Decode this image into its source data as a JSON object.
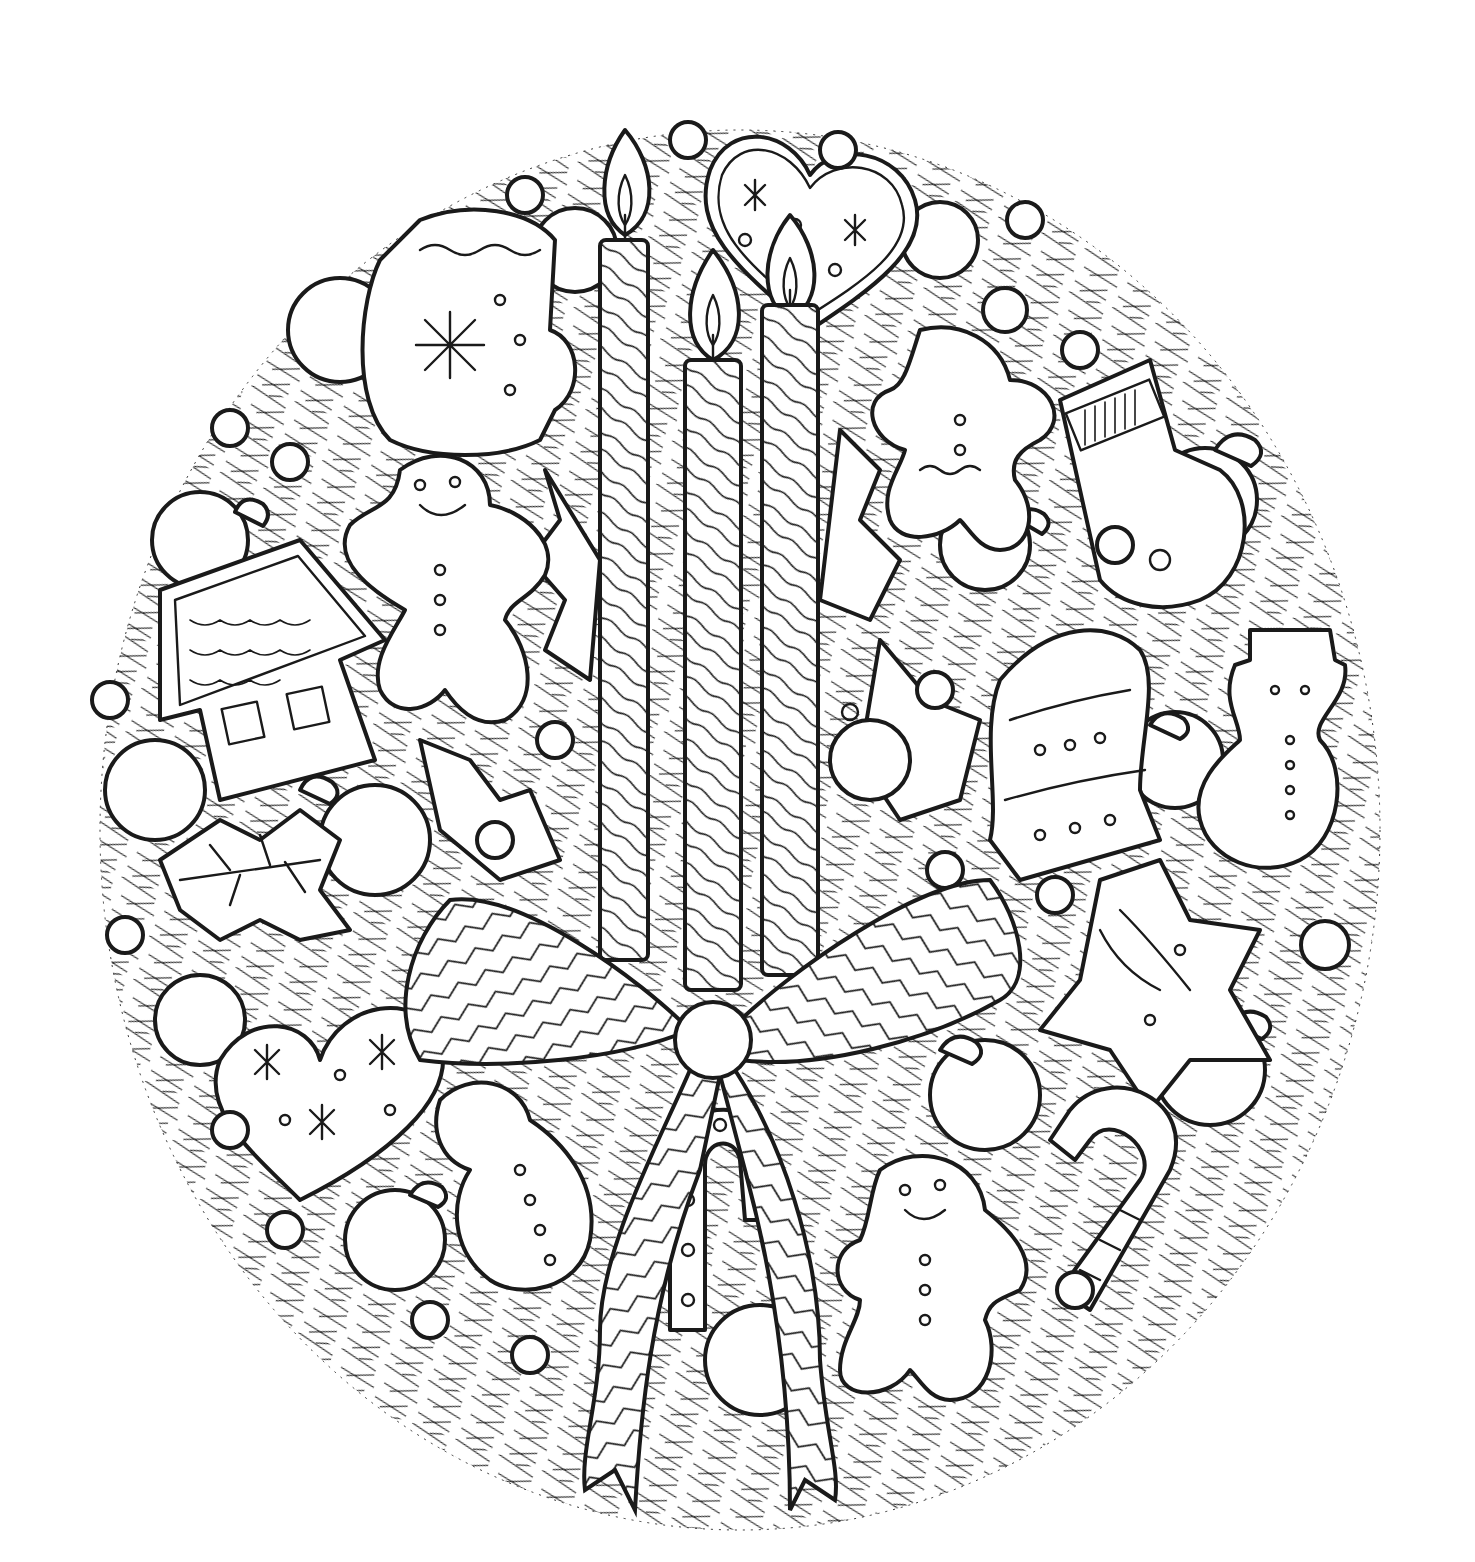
{
  "page": {
    "title": "",
    "background": "#ffffff",
    "ink_color": "#1a1a1a",
    "style": "black-and-white line-art coloring page"
  },
  "artwork": {
    "subject": "Christmas wreath with candles, bow and gingerbread cookies",
    "wreath": {
      "cx": 740,
      "cy": 830,
      "rx": 640,
      "ry": 700,
      "texture": "pine-needles"
    },
    "candles": [
      {
        "name": "left-candle",
        "x": 600,
        "top": 240,
        "bottom": 960,
        "width": 48,
        "flame_cy": 190
      },
      {
        "name": "middle-candle",
        "x": 685,
        "top": 360,
        "bottom": 990,
        "width": 56,
        "flame_cy": 300
      },
      {
        "name": "right-candle",
        "x": 762,
        "top": 305,
        "bottom": 975,
        "width": 56,
        "flame_cy": 250
      }
    ],
    "bow": {
      "knot_cx": 713,
      "knot_cy": 1040,
      "knot_r": 38,
      "pattern": "chevron-stripes"
    },
    "cookies": [
      {
        "name": "heart-cookie-top",
        "cx": 810,
        "cy": 240,
        "decor": [
          "snowflake",
          "snowflake",
          "dot",
          "dot",
          "dot"
        ]
      },
      {
        "name": "mitten-cookie",
        "cx": 470,
        "cy": 340,
        "decor": [
          "snowflake",
          "wavy-icing",
          "dots"
        ]
      },
      {
        "name": "gingerbread-man-left",
        "cx": 450,
        "cy": 580,
        "decor": [
          "smile",
          "buttons"
        ]
      },
      {
        "name": "gingerbread-house",
        "cx": 265,
        "cy": 660,
        "decor": [
          "scalloped-roof",
          "windows"
        ]
      },
      {
        "name": "gingerbread-man-top-right",
        "cx": 970,
        "cy": 450,
        "decor": [
          "buttons",
          "wavy-icing"
        ]
      },
      {
        "name": "stocking-cookie",
        "cx": 1160,
        "cy": 480,
        "decor": [
          "striped-cuff",
          "dots"
        ]
      },
      {
        "name": "bell-cookie",
        "cx": 1060,
        "cy": 760,
        "decor": [
          "dots",
          "bands"
        ]
      },
      {
        "name": "snowman-cookie-right",
        "cx": 1280,
        "cy": 740,
        "decor": [
          "hat",
          "buttons"
        ]
      },
      {
        "name": "star-cookie",
        "cx": 1140,
        "cy": 990,
        "decor": [
          "wavy-icing",
          "dots"
        ]
      },
      {
        "name": "holly-leaf-cookie",
        "cx": 250,
        "cy": 870,
        "decor": [
          "veins"
        ]
      },
      {
        "name": "heart-cookie-bottom",
        "cx": 330,
        "cy": 1090,
        "decor": [
          "snowflake",
          "snowflake",
          "dots"
        ]
      },
      {
        "name": "snowman-cookie-bottom",
        "cx": 520,
        "cy": 1180,
        "decor": [
          "buttons",
          "scarf"
        ]
      },
      {
        "name": "candy-cane-cookie-center",
        "cx": 720,
        "cy": 1250,
        "decor": [
          "dots",
          "stripes"
        ]
      },
      {
        "name": "gingerbread-man-bottom",
        "cx": 930,
        "cy": 1260,
        "decor": [
          "smile",
          "buttons"
        ]
      },
      {
        "name": "candy-cane-cookie-right",
        "cx": 1130,
        "cy": 1190,
        "decor": [
          "stripes",
          "dots"
        ]
      }
    ],
    "ornaments": [
      {
        "cx": 340,
        "cy": 330,
        "r": 52
      },
      {
        "cx": 575,
        "cy": 250,
        "r": 42
      },
      {
        "cx": 940,
        "cy": 240,
        "r": 38
      },
      {
        "cx": 1005,
        "cy": 310,
        "r": 22
      },
      {
        "cx": 200,
        "cy": 540,
        "r": 48
      },
      {
        "cx": 985,
        "cy": 545,
        "r": 45
      },
      {
        "cx": 1205,
        "cy": 500,
        "r": 52
      },
      {
        "cx": 155,
        "cy": 790,
        "r": 50
      },
      {
        "cx": 375,
        "cy": 840,
        "r": 55
      },
      {
        "cx": 870,
        "cy": 760,
        "r": 40
      },
      {
        "cx": 1175,
        "cy": 760,
        "r": 48
      },
      {
        "cx": 200,
        "cy": 1020,
        "r": 45
      },
      {
        "cx": 985,
        "cy": 1095,
        "r": 55
      },
      {
        "cx": 1210,
        "cy": 1070,
        "r": 55
      },
      {
        "cx": 395,
        "cy": 1240,
        "r": 50
      },
      {
        "cx": 760,
        "cy": 1360,
        "r": 55
      }
    ],
    "berries": [
      {
        "cx": 525,
        "cy": 195
      },
      {
        "cx": 688,
        "cy": 140
      },
      {
        "cx": 838,
        "cy": 150
      },
      {
        "cx": 1025,
        "cy": 220
      },
      {
        "cx": 1080,
        "cy": 350
      },
      {
        "cx": 230,
        "cy": 428
      },
      {
        "cx": 290,
        "cy": 462
      },
      {
        "cx": 110,
        "cy": 700
      },
      {
        "cx": 1115,
        "cy": 545
      },
      {
        "cx": 935,
        "cy": 690
      },
      {
        "cx": 555,
        "cy": 740
      },
      {
        "cx": 495,
        "cy": 840
      },
      {
        "cx": 1055,
        "cy": 895
      },
      {
        "cx": 1325,
        "cy": 945
      },
      {
        "cx": 125,
        "cy": 935
      },
      {
        "cx": 230,
        "cy": 1130
      },
      {
        "cx": 285,
        "cy": 1230
      },
      {
        "cx": 430,
        "cy": 1320
      },
      {
        "cx": 530,
        "cy": 1355
      },
      {
        "cx": 1075,
        "cy": 1290
      },
      {
        "cx": 945,
        "cy": 870
      }
    ]
  }
}
